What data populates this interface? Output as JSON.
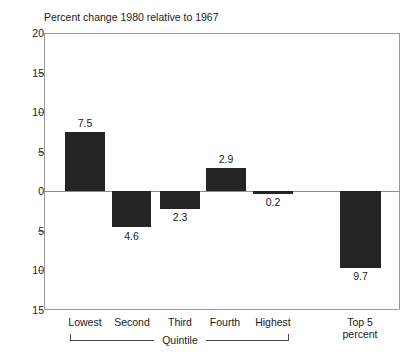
{
  "chart_data": {
    "type": "bar",
    "title": "Percent change 1980 relative to 1967",
    "xlabel": "Quintile",
    "ylabel": "",
    "ylim": [
      -15,
      20
    ],
    "grid": false,
    "legend": "none",
    "y_ticks": [
      {
        "value": 20,
        "label": "20"
      },
      {
        "value": 15,
        "label": "15"
      },
      {
        "value": 10,
        "label": "10"
      },
      {
        "value": 5,
        "label": "5"
      },
      {
        "value": 0,
        "label": "0"
      },
      {
        "value": -5,
        "label": "5"
      },
      {
        "value": -10,
        "label": "10"
      },
      {
        "value": -15,
        "label": "15"
      }
    ],
    "categories": [
      "Lowest",
      "Second",
      "Third",
      "Fourth",
      "Highest",
      "Top 5 percent"
    ],
    "values": [
      7.5,
      -4.6,
      -2.3,
      2.9,
      -0.2,
      -9.7
    ],
    "data_labels": [
      "7.5",
      "4.6",
      "2.3",
      "2.9",
      "0.2",
      "9.7"
    ],
    "group_bracket": {
      "label": "Quintile",
      "covers": [
        "Lowest",
        "Second",
        "Third",
        "Fourth",
        "Highest"
      ]
    },
    "bar_color": "#242424",
    "axis_color": "#9a9a9a",
    "background": "#ffffff"
  },
  "cat_lines": {
    "lowest": "Lowest",
    "second": "Second",
    "third": "Third",
    "fourth": "Fourth",
    "highest": "Highest",
    "top5_line1": "Top 5",
    "top5_line2": "percent"
  }
}
